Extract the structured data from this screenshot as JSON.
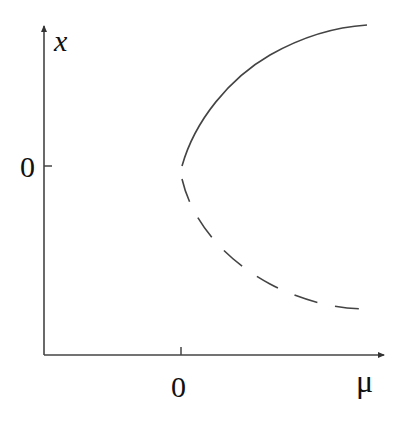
{
  "diagram": {
    "type": "bifurcation-diagram",
    "x_axis": {
      "label": "μ",
      "tick_label": "0"
    },
    "y_axis": {
      "label": "x",
      "tick_label": "0"
    },
    "branches": [
      {
        "name": "stable",
        "style": "solid",
        "description": "upper branch x = +sqrt(mu), mu > 0"
      },
      {
        "name": "unstable",
        "style": "dashed",
        "description": "lower branch x = -sqrt(mu), mu > 0"
      }
    ],
    "colors": {
      "line": "#333333",
      "background": "#ffffff"
    }
  }
}
